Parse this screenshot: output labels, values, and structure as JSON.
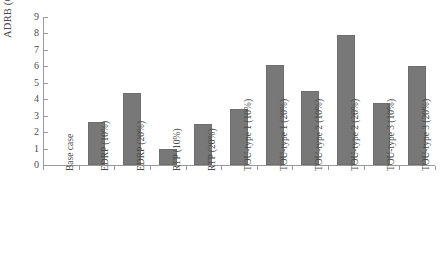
{
  "chart_data": {
    "type": "bar",
    "title": "",
    "xlabel": "",
    "ylabel": "ADRB (€/MWh)",
    "ylim": [
      0,
      9
    ],
    "ytick_labels": [
      "0",
      "1",
      "2",
      "3",
      "4",
      "5",
      "6",
      "7",
      "8",
      "9"
    ],
    "ytick_values": [
      0,
      1,
      2,
      3,
      4,
      5,
      6,
      7,
      8,
      9
    ],
    "grid": false,
    "legend": "none",
    "bar_color": "#787878",
    "axis_color": "#9a9a9a",
    "categories": [
      "Base case",
      "EDRP (10%)",
      "EDRP (20%)",
      "RTP (10%)",
      "RTP (20%)",
      "TOU-type 1 (10%)",
      "TOU-type 1 (20%)",
      "TOU-type 2 (10%)",
      "TOU-type 2 (20%)",
      "TOU-type 3 (10%)",
      "TOU-type 3 (20%)"
    ],
    "values": [
      0,
      2.6,
      4.4,
      1.0,
      2.5,
      3.4,
      6.1,
      4.5,
      7.9,
      3.8,
      6.0
    ]
  }
}
